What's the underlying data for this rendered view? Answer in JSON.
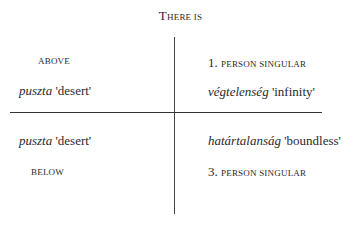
{
  "diagram": {
    "title": {
      "initial": "T",
      "rest": "HERE IS"
    },
    "quadrants": {
      "top_left": {
        "label": "ABOVE",
        "word": "puszta",
        "gloss": "'desert'"
      },
      "top_right": {
        "number": "1.",
        "label": "PERSON SINGULAR",
        "word": "végtelenség",
        "gloss": "'infinity'"
      },
      "bottom_left": {
        "word": "puszta",
        "gloss": "'desert'",
        "label": "BELOW"
      },
      "bottom_right": {
        "word": "határtalanság",
        "gloss": "'boundless'",
        "number": "3.",
        "label": "PERSON SINGULAR"
      }
    },
    "colors": {
      "text": "#2a2a2a",
      "lines": "#333333",
      "background": "#ffffff"
    }
  }
}
